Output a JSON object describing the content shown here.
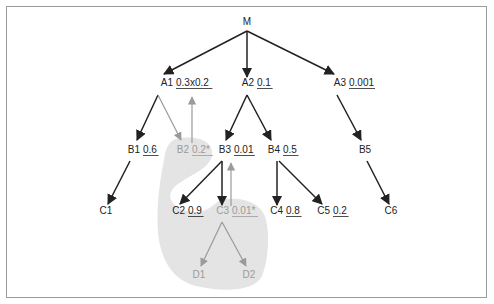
{
  "colors": {
    "dark": "#222222",
    "grey": "#9a9a9a",
    "shade": "#e4e4e4",
    "frame": "#9a9a9a"
  },
  "nodes": {
    "M": {
      "name": "M",
      "value": "",
      "x": 247,
      "y": 25
    },
    "A1": {
      "name": "A1",
      "value": "0.3x0.2",
      "x": 162,
      "y": 86,
      "vx": 176
    },
    "A2": {
      "name": "A2",
      "value": "0.1",
      "x": 247,
      "y": 86,
      "vx": 257
    },
    "A3": {
      "name": "A3",
      "value": "0.001",
      "x": 339,
      "y": 86,
      "vx": 349
    },
    "B1": {
      "name": "B1",
      "value": "0.6",
      "x": 134,
      "y": 153,
      "vx": 143
    },
    "B2": {
      "name": "B2",
      "value": "0.2*",
      "x": 182,
      "y": 153,
      "vx": 192,
      "muted": true
    },
    "B3": {
      "name": "B3",
      "value": "0.01",
      "x": 225,
      "y": 153,
      "vx": 234
    },
    "B4": {
      "name": "B4",
      "value": "0.5",
      "x": 274,
      "y": 153,
      "vx": 283
    },
    "B5": {
      "name": "B5",
      "value": "",
      "x": 365,
      "y": 153
    },
    "C1": {
      "name": "C1",
      "value": "",
      "x": 106,
      "y": 214
    },
    "C2": {
      "name": "C2",
      "value": "0.9",
      "x": 179,
      "y": 214,
      "vx": 188
    },
    "C3": {
      "name": "C3",
      "value": "0.01*",
      "x": 224,
      "y": 214,
      "vx": 232,
      "muted": true
    },
    "C4": {
      "name": "C4",
      "value": "0.8",
      "x": 277,
      "y": 214,
      "vx": 286
    },
    "C5": {
      "name": "C5",
      "value": "0.2",
      "x": 324,
      "y": 214,
      "vx": 333
    },
    "C6": {
      "name": "C6",
      "value": "",
      "x": 391,
      "y": 214
    },
    "D1": {
      "name": "D1",
      "value": "",
      "x": 199,
      "y": 278,
      "muted": true
    },
    "D2": {
      "name": "D2",
      "value": "",
      "x": 249,
      "y": 278,
      "muted": true
    }
  },
  "edges": [
    {
      "from": "M",
      "to": "A1",
      "x1": 247,
      "y1": 31,
      "x2": 164,
      "y2": 74
    },
    {
      "from": "M",
      "to": "A2",
      "x1": 247,
      "y1": 31,
      "x2": 247,
      "y2": 77
    },
    {
      "from": "M",
      "to": "A3",
      "x1": 247,
      "y1": 31,
      "x2": 334,
      "y2": 74
    },
    {
      "from": "A1",
      "to": "B1",
      "x1": 158,
      "y1": 95,
      "x2": 137,
      "y2": 140
    },
    {
      "from": "A1",
      "to": "B2",
      "x1": 158,
      "y1": 95,
      "x2": 181,
      "y2": 140,
      "muted": true
    },
    {
      "from": "B2",
      "to": "A1",
      "x1": 192,
      "y1": 143,
      "x2": 192,
      "y2": 97,
      "muted": true
    },
    {
      "from": "A2",
      "to": "B3",
      "x1": 247,
      "y1": 95,
      "x2": 226,
      "y2": 140
    },
    {
      "from": "A2",
      "to": "B4",
      "x1": 247,
      "y1": 95,
      "x2": 271,
      "y2": 140
    },
    {
      "from": "A3",
      "to": "B5",
      "x1": 337,
      "y1": 95,
      "x2": 361,
      "y2": 140
    },
    {
      "from": "B1",
      "to": "C1",
      "x1": 130,
      "y1": 161,
      "x2": 108,
      "y2": 204
    },
    {
      "from": "B3",
      "to": "C2",
      "x1": 222,
      "y1": 161,
      "x2": 180,
      "y2": 204
    },
    {
      "from": "B3",
      "to": "C3",
      "x1": 222,
      "y1": 161,
      "x2": 222,
      "y2": 205
    },
    {
      "from": "C3",
      "to": "B3",
      "x1": 231,
      "y1": 206,
      "x2": 231,
      "y2": 163,
      "muted": true
    },
    {
      "from": "B4",
      "to": "C4",
      "x1": 277,
      "y1": 161,
      "x2": 277,
      "y2": 205
    },
    {
      "from": "B4",
      "to": "C5",
      "x1": 279,
      "y1": 161,
      "x2": 322,
      "y2": 204
    },
    {
      "from": "B5",
      "to": "C6",
      "x1": 367,
      "y1": 161,
      "x2": 389,
      "y2": 204
    },
    {
      "from": "C3",
      "to": "D1",
      "x1": 222,
      "y1": 222,
      "x2": 201,
      "y2": 266,
      "muted": true
    },
    {
      "from": "C3",
      "to": "D2",
      "x1": 222,
      "y1": 222,
      "x2": 246,
      "y2": 266,
      "muted": true
    }
  ]
}
